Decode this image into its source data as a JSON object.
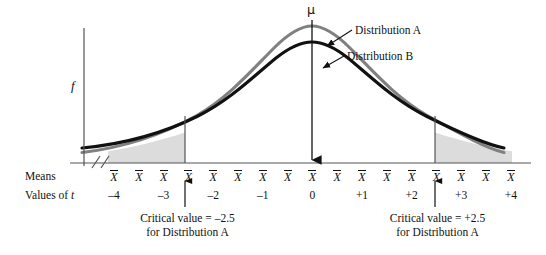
{
  "axes": {
    "y_label": "f",
    "x_row1_label": "Means",
    "x_row2_label": "Values of t",
    "mean_symbol": "X",
    "mu_symbol": "μ"
  },
  "legend": {
    "series_a": "Distribution A",
    "series_b": "Distribution B"
  },
  "annotations": {
    "critical_left_line1": "Critical value = –2.5",
    "critical_left_line2": "for Distribution A",
    "critical_right_line1": "Critical value = +2.5",
    "critical_right_line2": "for Distribution A"
  },
  "colors": {
    "series_a": "#808080",
    "series_b": "#111111",
    "axis": "#555555",
    "shaded_tail": "#d9d9d9"
  },
  "chart_data": {
    "type": "line",
    "title": "",
    "xlabel": "Values of t",
    "ylabel": "f",
    "grid": false,
    "legend_position": "inline-callout",
    "xlim": [
      -4.6,
      4.6
    ],
    "ylim": [
      0,
      1.06
    ],
    "tick_labels": [
      "-4",
      "-3",
      "-2",
      "-1",
      "0",
      "+1",
      "+2",
      "+3",
      "+4"
    ],
    "tick_values": [
      -4,
      -3,
      -2,
      -1,
      0,
      1,
      2,
      3,
      4
    ],
    "mean_marker_count": 17,
    "critical_values": [
      -2.5,
      2.5
    ],
    "shaded_regions": [
      {
        "from": -4.6,
        "to": -2.5,
        "label": "rejection region (lower tail)"
      },
      {
        "from": 2.5,
        "to": 4.6,
        "label": "rejection region (upper tail)"
      }
    ],
    "series": [
      {
        "name": "Distribution A",
        "color": "#808080",
        "peak": 1.0,
        "x": [
          -4.6,
          -4.2,
          -3.8,
          -3.4,
          -3.0,
          -2.6,
          -2.2,
          -1.8,
          -1.4,
          -1.0,
          -0.6,
          -0.2,
          0.0,
          0.2,
          0.6,
          1.0,
          1.4,
          1.8,
          2.2,
          2.6,
          3.0,
          3.4,
          3.8,
          4.2,
          4.6
        ],
        "y": [
          0.15,
          0.17,
          0.196,
          0.228,
          0.27,
          0.322,
          0.39,
          0.474,
          0.58,
          0.7,
          0.84,
          0.975,
          1.0,
          0.975,
          0.84,
          0.7,
          0.58,
          0.474,
          0.39,
          0.322,
          0.27,
          0.228,
          0.196,
          0.17,
          0.15
        ]
      },
      {
        "name": "Distribution B",
        "color": "#111111",
        "peak": 0.86,
        "x": [
          -4.6,
          -4.2,
          -3.8,
          -3.4,
          -3.0,
          -2.6,
          -2.2,
          -1.8,
          -1.4,
          -1.0,
          -0.6,
          -0.2,
          0.0,
          0.2,
          0.6,
          1.0,
          1.4,
          1.8,
          2.2,
          2.6,
          3.0,
          3.4,
          3.8,
          4.2,
          4.6
        ],
        "y": [
          0.186,
          0.206,
          0.232,
          0.264,
          0.304,
          0.356,
          0.42,
          0.5,
          0.596,
          0.7,
          0.8,
          0.85,
          0.86,
          0.85,
          0.8,
          0.7,
          0.596,
          0.5,
          0.42,
          0.356,
          0.304,
          0.264,
          0.232,
          0.206,
          0.186
        ]
      }
    ]
  }
}
